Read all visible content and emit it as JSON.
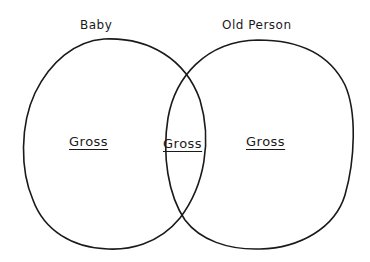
{
  "diagram": {
    "type": "venn",
    "style": "hand-drawn",
    "stroke_color": "#1a1a1a",
    "background": "#ffffff",
    "sets": [
      {
        "id": "A",
        "label": "Baby",
        "region_label": "Gross"
      },
      {
        "id": "B",
        "label": "Old Person",
        "region_label": "Gross"
      }
    ],
    "intersection": {
      "sets": [
        "A",
        "B"
      ],
      "region_label": "Gross"
    }
  }
}
